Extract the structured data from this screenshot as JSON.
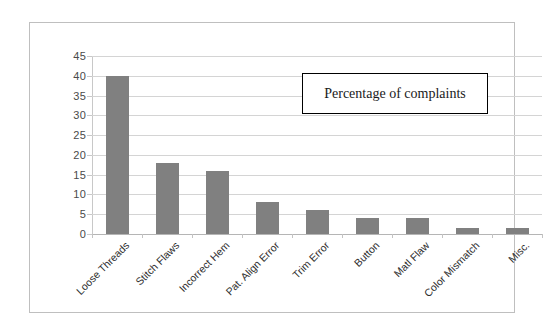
{
  "chart_data": {
    "type": "bar",
    "title": "",
    "legend_label": "Percentage of complaints",
    "legend_position": "inside-top-right",
    "xlabel": "",
    "ylabel": "",
    "ylim": [
      0,
      45
    ],
    "ytick_step": 5,
    "yticks": [
      45,
      40,
      35,
      30,
      25,
      20,
      15,
      10,
      5,
      0
    ],
    "grid": true,
    "categories": [
      "Loose Threads",
      "Stitch Flaws",
      "Incorrect Hem",
      "Pat. Align Error",
      "Trim Error",
      "Button",
      "Matl Flaw",
      "Color Mismatch",
      "Misc."
    ],
    "values": [
      40,
      18,
      16,
      8,
      6,
      4,
      4,
      1.5,
      1.5
    ],
    "series": [
      {
        "name": "Percentage of complaints",
        "values": [
          40,
          18,
          16,
          8,
          6,
          4,
          4,
          1.5,
          1.5
        ]
      }
    ]
  },
  "style": {
    "bar_color": "#808080",
    "gridline_color": "#d4d4d4",
    "axis_color": "#c8c8c8",
    "frame_color": "#bfbfbf",
    "legend_border_color": "#000000",
    "background": "#ffffff",
    "tick_label_color": "#4a4a4a",
    "category_label_color": "#2e2e2e"
  }
}
